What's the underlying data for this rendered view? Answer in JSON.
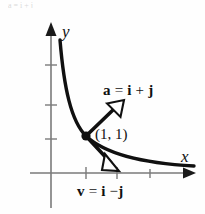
{
  "figure": {
    "name": "vector-diagram-hyperbola",
    "background_color": "#fefefe",
    "ink_color": "#101010",
    "axis_color": "#7a7a7a",
    "width": 205,
    "height": 214,
    "top_partial_text": "a = i + j"
  },
  "axes": {
    "x_label": "x",
    "y_label": "y",
    "origin": {
      "x": 51,
      "y": 173
    },
    "x_axis": {
      "x_start": 30,
      "x_end": 196,
      "y": 173,
      "arrow": "right"
    },
    "y_axis": {
      "x": 51,
      "y_start": 208,
      "y_end": 24,
      "arrow": "up"
    },
    "x_ticks": [
      86,
      117,
      150
    ],
    "y_ticks": [
      65,
      105,
      139
    ]
  },
  "curve": {
    "name": "hyperbola-xy-equals-1",
    "description": "decreasing convex curve through (1, 1)",
    "points": "M 60 40 C 64 88, 72 122, 86 136 C 104 153, 140 163, 194 166"
  },
  "point": {
    "label": "(1, 1)",
    "x": 86,
    "y": 136,
    "radius": 4.5
  },
  "vectors": [
    {
      "name": "acceleration-vector",
      "label_parts": {
        "lhs": "a",
        "eq": "=",
        "rhs1": "i",
        "op": "+",
        "rhs2": "j"
      },
      "label_text": "a = i + j",
      "from": {
        "x": 86,
        "y": 136
      },
      "to": {
        "x": 119,
        "y": 104
      },
      "arrowhead": "open",
      "label_pos": {
        "x": 97,
        "y": 81
      }
    },
    {
      "name": "velocity-vector",
      "label_parts": {
        "lhs": "v",
        "eq": "=",
        "rhs1": "i",
        "op": "−",
        "rhs2": "j"
      },
      "label_text": "v = i − j",
      "from": {
        "x": 86,
        "y": 136
      },
      "to": {
        "x": 117,
        "y": 168
      },
      "arrowhead": "open",
      "label_pos": {
        "x": 74,
        "y": 184
      }
    }
  ]
}
